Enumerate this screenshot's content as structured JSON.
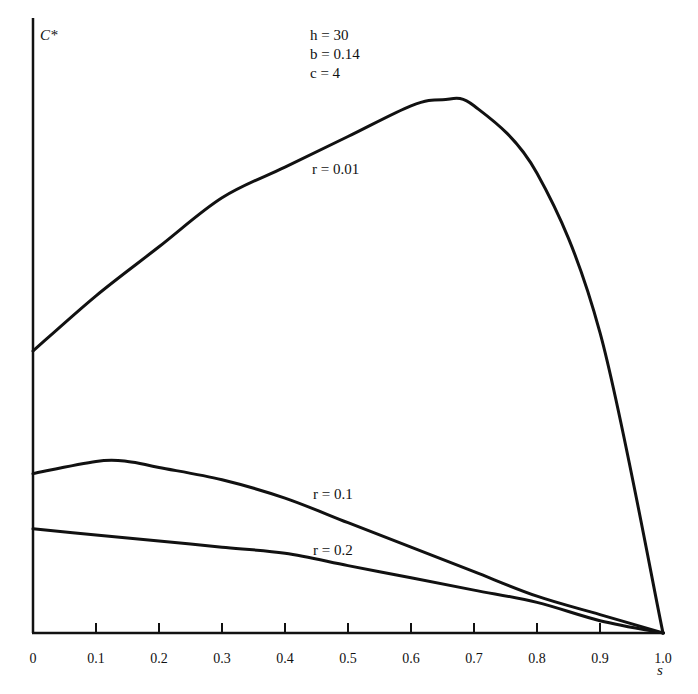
{
  "chart_data": {
    "type": "line",
    "title": "",
    "xlabel": "s",
    "ylabel": "C*",
    "xlim": [
      0,
      1.0
    ],
    "ylim": [
      0,
      1.0
    ],
    "y_units_note": "relative (no y tick labels shown)",
    "grid": false,
    "x_ticks": [
      "0",
      "0.1",
      "0.2",
      "0.3",
      "0.4",
      "0.5",
      "0.6",
      "0.7",
      "0.8",
      "0.9",
      "1.0"
    ],
    "annotations": {
      "params": [
        "h = 30",
        "b = 0.14",
        "c = 4"
      ]
    },
    "series": [
      {
        "name": "r = 0.01",
        "x": [
          0,
          0.1,
          0.2,
          0.3,
          0.4,
          0.5,
          0.6,
          0.65,
          0.7,
          0.8,
          0.9,
          1.0
        ],
        "values": [
          0.46,
          0.55,
          0.63,
          0.71,
          0.76,
          0.81,
          0.86,
          0.87,
          0.86,
          0.75,
          0.49,
          0.0
        ]
      },
      {
        "name": "r = 0.1",
        "x": [
          0,
          0.1,
          0.15,
          0.2,
          0.3,
          0.4,
          0.5,
          0.6,
          0.7,
          0.8,
          0.9,
          1.0
        ],
        "values": [
          0.26,
          0.28,
          0.28,
          0.27,
          0.25,
          0.22,
          0.18,
          0.14,
          0.1,
          0.06,
          0.03,
          0.0
        ]
      },
      {
        "name": "r = 0.2",
        "x": [
          0,
          0.1,
          0.2,
          0.3,
          0.4,
          0.5,
          0.6,
          0.7,
          0.8,
          0.9,
          1.0
        ],
        "values": [
          0.17,
          0.16,
          0.15,
          0.14,
          0.13,
          0.11,
          0.09,
          0.07,
          0.05,
          0.02,
          0.0
        ]
      }
    ]
  },
  "labels": {
    "y_axis": "C*",
    "x_axis": "s",
    "param_h": "h = 30",
    "param_b": "b = 0.14",
    "param_c": "c = 4",
    "curve_r001": "r = 0.01",
    "curve_r01": "r = 0.1",
    "curve_r02": "r = 0.2"
  }
}
